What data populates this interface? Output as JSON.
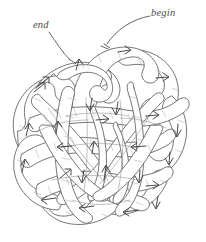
{
  "figure": {
    "kind": "hand-drawn-knot-diagram",
    "background_color": "#ffffff",
    "ink_color": "#5a5a5a",
    "ink_color_dark": "#3a3a3a",
    "width": 206,
    "height": 242
  },
  "labels": {
    "begin": "begin",
    "end": "end"
  },
  "annotations": {
    "leader_begin_name": "leader-line-begin",
    "leader_end_name": "leader-line-end",
    "arrow_count": 26,
    "arrow_meaning": "travel direction of the band"
  },
  "geometry": {
    "center_x": 101,
    "center_y": 140,
    "outer_radius_x": 89,
    "outer_radius_y": 86,
    "band_width": 13,
    "lobes": 7,
    "begin_point_x": 106,
    "begin_point_y": 45,
    "end_point_x": 72,
    "end_point_y": 60
  }
}
